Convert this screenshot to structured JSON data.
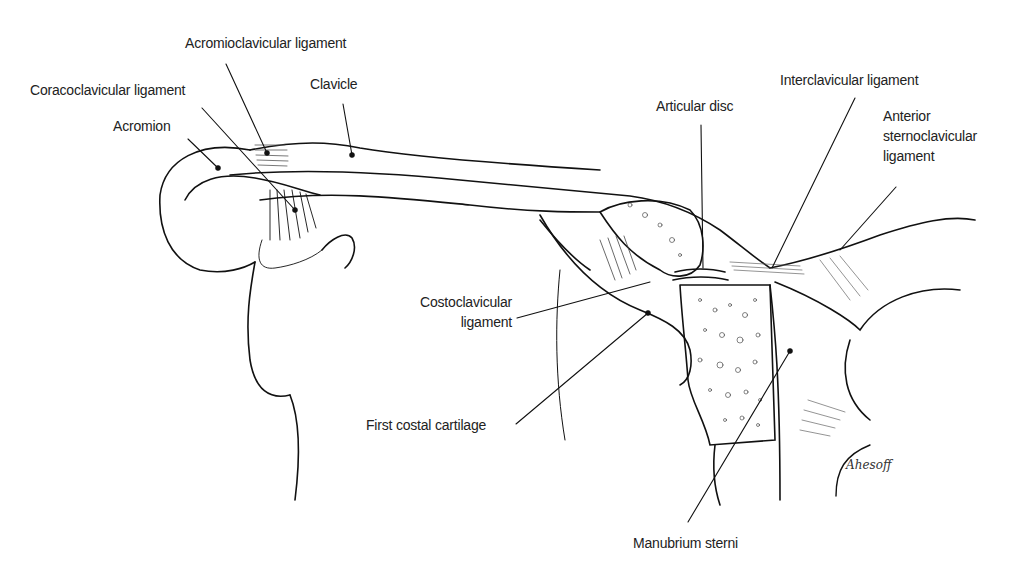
{
  "diagram": {
    "labels": [
      {
        "id": "acromioclavicular-ligament",
        "text": "Acromioclavicular ligament"
      },
      {
        "id": "coracoclavicular-ligament",
        "text": "Coracoclavicular ligament"
      },
      {
        "id": "clavicle",
        "text": "Clavicle"
      },
      {
        "id": "acromion",
        "text": "Acromion"
      },
      {
        "id": "articular-disc",
        "text": "Articular disc"
      },
      {
        "id": "interclavicular-ligament",
        "text": "Interclavicular ligament"
      },
      {
        "id": "anterior-sternoclavicular-ligament",
        "line1": "Anterior",
        "line2": "sternoclavicular",
        "line3": "ligament"
      },
      {
        "id": "costoclavicular-ligament",
        "line1": "Costoclavicular",
        "line2": "ligament"
      },
      {
        "id": "first-costal-cartilage",
        "text": "First costal cartilage"
      },
      {
        "id": "manubrium-sterni",
        "text": "Manubrium sterni"
      }
    ],
    "signature": "Ahesoff"
  }
}
